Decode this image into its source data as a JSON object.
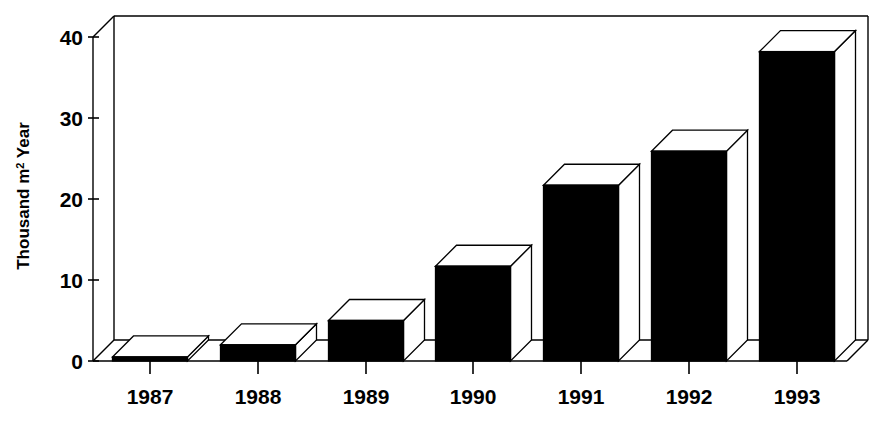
{
  "chart_data": {
    "type": "bar",
    "title": "",
    "subtitle": "",
    "xlabel": "",
    "ylabel": "Thousand m² Year",
    "ylabel_parts": {
      "prefix": "Thousand m",
      "superscript": "2",
      "suffix": " Year"
    },
    "categories": [
      "1987",
      "1988",
      "1989",
      "1990",
      "1991",
      "1992",
      "1993"
    ],
    "values": [
      0.5,
      2,
      5,
      11.7,
      21.7,
      25.9,
      38.2
    ],
    "ylim": [
      0,
      42
    ],
    "yticks": [
      0,
      10,
      20,
      30,
      40
    ],
    "ytick_labels": [
      "0",
      "10",
      "20",
      "30",
      "40"
    ],
    "grid": false,
    "legend": null,
    "style": "3d-column",
    "colors": {
      "bar_front": "#000000",
      "bar_top": "#ffffff",
      "bar_side": "#ffffff",
      "axis": "#000000",
      "background": "#ffffff"
    }
  }
}
